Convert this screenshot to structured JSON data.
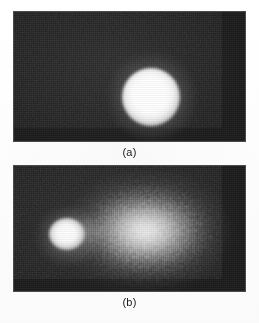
{
  "figure": {
    "background_color": "#fdfdfd",
    "panel_count": 2,
    "panels": [
      {
        "id": "a",
        "caption": "(a)",
        "kind": "grayscale-intensity-image",
        "background_color": "#222222",
        "features": [
          {
            "name": "bright-spot",
            "description": "single compact saturated white circular spot",
            "center_x_px": 138,
            "center_y_px": 85,
            "core_radius_px": 15,
            "halo_radius_px": 30,
            "peak_color": "#ffffff"
          }
        ]
      },
      {
        "id": "b",
        "caption": "(b)",
        "kind": "grayscale-intensity-image",
        "background_color": "#222222",
        "features": [
          {
            "name": "bright-knot",
            "description": "small compact saturated white knot at left",
            "center_x_px": 58,
            "center_y_px": 231,
            "core_radius_px": 9,
            "halo_radius_px": 20,
            "peak_color": "#ffffff"
          },
          {
            "name": "diffuse-plume",
            "description": "large grainy speckled elliptical cloud extending to the right",
            "center_x_px": 151,
            "center_y_px": 228,
            "width_px": 150,
            "height_px": 104,
            "peak_color": "#ededed"
          },
          {
            "name": "connecting-bridge",
            "description": "faint low-intensity bridge linking the knot to the plume",
            "center_x_px": 93,
            "center_y_px": 231
          }
        ]
      }
    ]
  },
  "captions": {
    "panel_a_label": "(a)",
    "panel_b_label": "(b)"
  }
}
